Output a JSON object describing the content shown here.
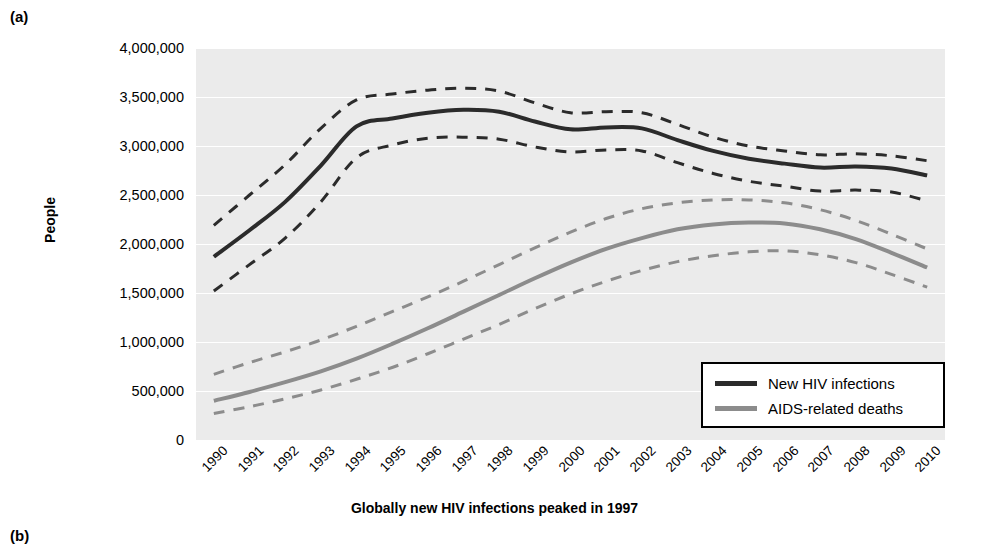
{
  "panels": {
    "a_label": "(a)",
    "b_label": "(b)"
  },
  "colors": {
    "plot_background": "#ebebeb",
    "gridline": "#ffffff",
    "hiv_line": "#2b2b2b",
    "aids_line": "#8c8c8c",
    "text": "#000000"
  },
  "legend": {
    "position": "bottom-right",
    "entries": [
      {
        "label": "New HIV infections",
        "color": "#2b2b2b",
        "icon": "line-swatch-dark"
      },
      {
        "label": "AIDS-related deaths",
        "color": "#8c8c8c",
        "icon": "line-swatch-gray"
      }
    ]
  },
  "chart_data": {
    "type": "line",
    "title": "",
    "caption": "Globally new HIV infections peaked in 1997",
    "xlabel": "",
    "ylabel": "People",
    "ylim": [
      0,
      4000000
    ],
    "ytick_step": 500000,
    "ytick_labels": [
      "4,000,000",
      "3,500,000",
      "3,000,000",
      "2,500,000",
      "2,000,000",
      "1,500,000",
      "1,000,000",
      "500,000",
      "0"
    ],
    "ytick_values": [
      4000000,
      3500000,
      3000000,
      2500000,
      2000000,
      1500000,
      1000000,
      500000,
      0
    ],
    "grid": true,
    "grid_axis": "y",
    "x": [
      "1990",
      "1991",
      "1992",
      "1993",
      "1994",
      "1995",
      "1996",
      "1997",
      "1998",
      "1999",
      "2000",
      "2001",
      "2002",
      "2003",
      "2004",
      "2005",
      "2006",
      "2007",
      "2008",
      "2009",
      "2010"
    ],
    "series": [
      {
        "name": "New HIV infections",
        "color": "#2b2b2b",
        "style": "solid",
        "values": [
          1870000,
          2140000,
          2430000,
          2800000,
          3200000,
          3280000,
          3340000,
          3370000,
          3350000,
          3250000,
          3170000,
          3190000,
          3180000,
          3060000,
          2950000,
          2870000,
          2820000,
          2780000,
          2790000,
          2770000,
          2700000
        ]
      },
      {
        "name": "New HIV infections upper bound",
        "color": "#2b2b2b",
        "style": "dashed",
        "values": [
          2190000,
          2500000,
          2810000,
          3180000,
          3470000,
          3530000,
          3570000,
          3590000,
          3560000,
          3440000,
          3340000,
          3350000,
          3340000,
          3220000,
          3090000,
          3000000,
          2950000,
          2910000,
          2920000,
          2900000,
          2850000
        ]
      },
      {
        "name": "New HIV infections lower bound",
        "color": "#2b2b2b",
        "style": "dashed",
        "values": [
          1520000,
          1790000,
          2060000,
          2430000,
          2880000,
          3010000,
          3080000,
          3090000,
          3070000,
          2990000,
          2940000,
          2960000,
          2950000,
          2830000,
          2720000,
          2640000,
          2590000,
          2540000,
          2550000,
          2530000,
          2440000
        ]
      },
      {
        "name": "AIDS-related deaths",
        "color": "#8c8c8c",
        "style": "solid",
        "values": [
          400000,
          490000,
          590000,
          700000,
          830000,
          980000,
          1140000,
          1310000,
          1480000,
          1650000,
          1810000,
          1950000,
          2060000,
          2150000,
          2200000,
          2220000,
          2210000,
          2150000,
          2050000,
          1910000,
          1760000
        ]
      },
      {
        "name": "AIDS-related deaths upper bound",
        "color": "#8c8c8c",
        "style": "dashed",
        "values": [
          670000,
          790000,
          900000,
          1020000,
          1160000,
          1310000,
          1460000,
          1620000,
          1790000,
          1960000,
          2120000,
          2260000,
          2360000,
          2420000,
          2450000,
          2450000,
          2420000,
          2350000,
          2240000,
          2100000,
          1950000
        ]
      },
      {
        "name": "AIDS-related deaths lower bound",
        "color": "#8c8c8c",
        "style": "dashed",
        "values": [
          270000,
          340000,
          420000,
          510000,
          620000,
          740000,
          880000,
          1030000,
          1180000,
          1340000,
          1490000,
          1620000,
          1730000,
          1820000,
          1880000,
          1920000,
          1930000,
          1890000,
          1810000,
          1690000,
          1560000
        ]
      }
    ]
  }
}
